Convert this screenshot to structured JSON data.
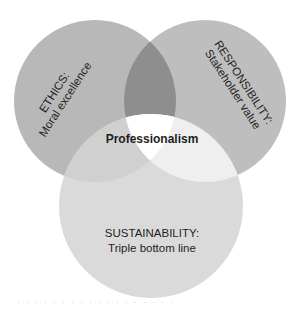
{
  "diagram": {
    "type": "venn",
    "center_label": "Professionalism",
    "circles": [
      {
        "id": "ethics",
        "title": "ETHICS:",
        "subtitle": "Moral excellence",
        "color": "#b8b8b8"
      },
      {
        "id": "responsibility",
        "title": "RESPONSIBILITY:",
        "subtitle": "Stakeholder value",
        "color": "#bebebe"
      },
      {
        "id": "sustainability",
        "title": "SUSTAINABILITY:",
        "subtitle": "Triple bottom line",
        "color": "#dadada"
      }
    ],
    "overlap_colors": {
      "ethics_responsibility": "#8e8e8e",
      "ethics_sustainability": "#d0d0d0",
      "responsibility_sustainability": "#efefef",
      "all_three": "#ffffff"
    }
  }
}
